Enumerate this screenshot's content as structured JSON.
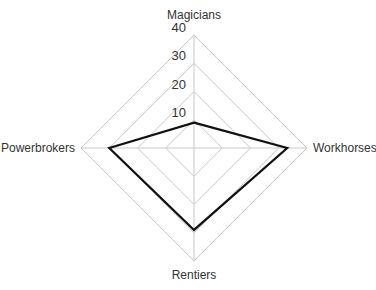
{
  "chart_data": {
    "type": "radar",
    "title": "",
    "axes": [
      "Magicians",
      "Workhorses",
      "Rentiers",
      "Powerbrokers"
    ],
    "series": [
      {
        "name": "",
        "values": [
          9,
          33,
          29,
          30
        ],
        "color": "#111111"
      }
    ],
    "rlim": [
      0,
      40
    ],
    "ticks": [
      10,
      20,
      30,
      40
    ],
    "tick_labels": [
      "10",
      "20",
      "30",
      "40"
    ],
    "grid": true,
    "legend": "none",
    "grid_color": "#c8c8c8"
  }
}
